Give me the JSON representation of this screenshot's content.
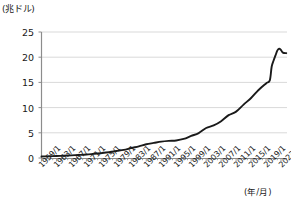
{
  "chart_data": {
    "type": "line",
    "title": "",
    "subtitle": "",
    "ylabel": "(兆ドル)",
    "xlabel": "(年/月)",
    "ylim": [
      0,
      25
    ],
    "yticks": [
      0,
      5,
      10,
      15,
      20,
      25
    ],
    "ytick_labels": [
      "0",
      "5",
      "10",
      "15",
      "20",
      "25"
    ],
    "grid": "horizontal",
    "legend": "none",
    "line_color": "#1a1a1a",
    "grid_color": "#d9d9d9",
    "axis_color": "#808080",
    "xtick_labels": [
      "1959/1",
      "1963/1",
      "1967/1",
      "1971/1",
      "1975/1",
      "1979/1",
      "1983/1",
      "1987/1",
      "1991/1",
      "1995/1",
      "1999/1",
      "2003/1",
      "2007/1",
      "2011/1",
      "2015/1",
      "2019/1",
      "2023/1"
    ],
    "xlim": [
      "1959/1",
      "2024/6"
    ],
    "x": [
      1959,
      1961,
      1963,
      1965,
      1967,
      1969,
      1971,
      1973,
      1975,
      1977,
      1979,
      1981,
      1983,
      1985,
      1987,
      1989,
      1991,
      1993,
      1995,
      1997,
      1999,
      2001,
      2003,
      2005,
      2007,
      2009,
      2011,
      2013,
      2015,
      2017,
      2019,
      2020,
      2020.5,
      2021,
      2021.5,
      2022,
      2022.5,
      2023,
      2023.5,
      2024.4
    ],
    "values": [
      0.29,
      0.34,
      0.39,
      0.46,
      0.53,
      0.6,
      0.69,
      0.83,
      0.97,
      1.14,
      1.38,
      1.6,
      1.98,
      2.3,
      2.72,
      2.99,
      3.25,
      3.4,
      3.48,
      3.78,
      4.38,
      4.95,
      5.95,
      6.46,
      7.3,
      8.5,
      9.2,
      10.6,
      11.9,
      13.5,
      14.8,
      15.4,
      18.1,
      19.3,
      20.3,
      21.3,
      21.7,
      21.4,
      20.9,
      20.8
    ],
    "series": [
      {
        "name": "マネーストック",
        "values": [
          0.29,
          0.34,
          0.39,
          0.46,
          0.53,
          0.6,
          0.69,
          0.83,
          0.97,
          1.14,
          1.38,
          1.6,
          1.98,
          2.3,
          2.72,
          2.99,
          3.25,
          3.4,
          3.48,
          3.78,
          4.38,
          4.95,
          5.95,
          6.46,
          7.3,
          8.5,
          9.2,
          10.6,
          11.9,
          13.5,
          14.8,
          15.4,
          18.1,
          19.3,
          20.3,
          21.3,
          21.7,
          21.4,
          20.9,
          20.8
        ]
      }
    ],
    "annotations": [],
    "peak_value": 21.7,
    "end_value": 20.8,
    "start_value": 0.29
  }
}
